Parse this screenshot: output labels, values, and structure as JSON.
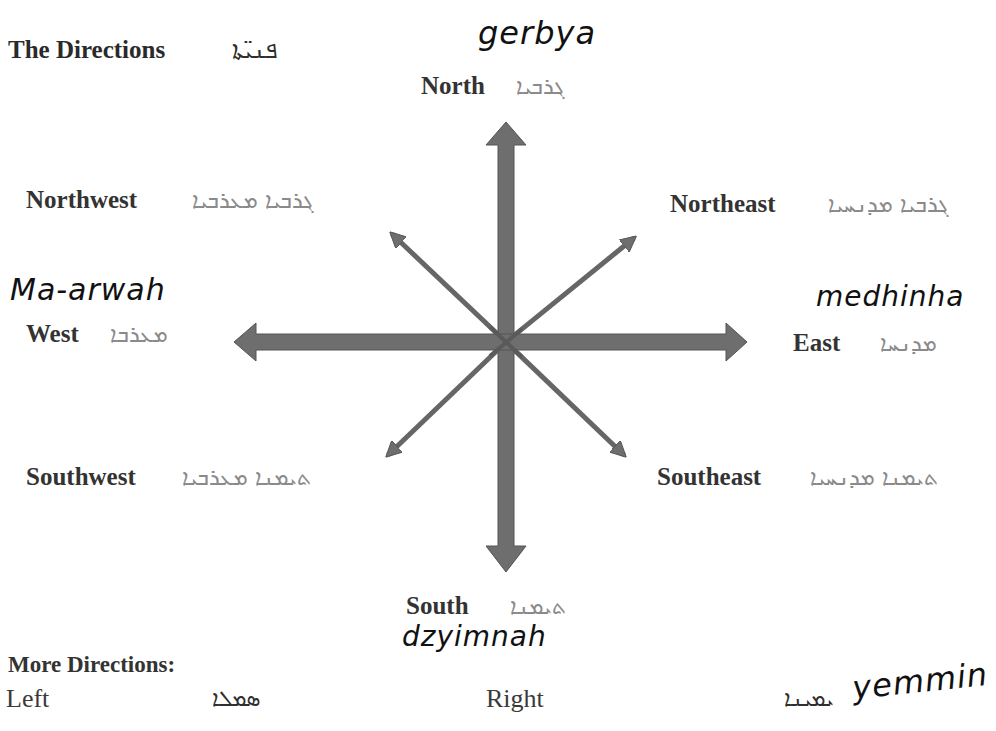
{
  "title": {
    "english": "The Directions",
    "syriac": "ܦܢܝ̈ܬܐ"
  },
  "directions": {
    "north": {
      "label": "North",
      "syriac": "ܓܪܒܝܐ",
      "handwritten": "gerbya"
    },
    "northwest": {
      "label": "Northwest",
      "syriac": "ܓܪܒܝܐ ܡܥܪܒܝܐ"
    },
    "northeast": {
      "label": "Northeast",
      "syriac": "ܓܪܒܝܐ ܡܕܢܚܝܐ"
    },
    "west": {
      "label": "West",
      "syriac": "ܡܥܪܒܐ",
      "handwritten": "Ma-arwah"
    },
    "east": {
      "label": "East",
      "syriac": "ܡܕܢܚܐ",
      "handwritten": "medhinha"
    },
    "southwest": {
      "label": "Southwest",
      "syriac": "ܬܝܡܢܐ ܡܥܪܒܝܐ"
    },
    "southeast": {
      "label": "Southeast",
      "syriac": "ܬܝܡܢܐ ܡܕܢܚܝܐ"
    },
    "south": {
      "label": "South",
      "syriac": "ܬܝܡܢܐ",
      "handwritten": "dzyimnah"
    }
  },
  "more_directions": {
    "heading": "More Directions:",
    "items": [
      {
        "label": "Left",
        "syriac": "ܣܡܠܐ"
      },
      {
        "label": "Right",
        "syriac": "ܝܡܝܢܐ",
        "handwritten": "yemmin"
      }
    ]
  },
  "colors": {
    "arrow_fill": "#6e6e6e",
    "arrow_stroke": "#555555",
    "syriac_text": "#8a8a8a",
    "label_text": "#333333"
  },
  "compass": {
    "center": [
      506,
      342
    ],
    "tips": {
      "north": [
        506,
        122
      ],
      "south": [
        506,
        572
      ],
      "west": [
        234,
        342
      ],
      "east": [
        747,
        342
      ],
      "northwest": [
        388,
        231
      ],
      "northeast": [
        638,
        235
      ],
      "southwest": [
        384,
        458
      ],
      "southeast": [
        627,
        458
      ]
    }
  }
}
